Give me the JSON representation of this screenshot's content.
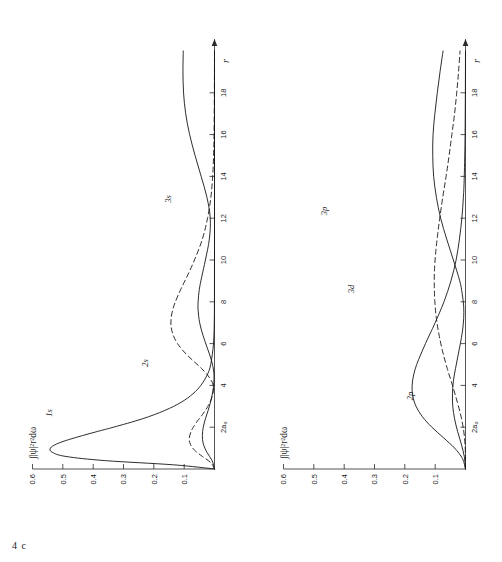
{
  "figures": [
    {
      "tag": "4 c",
      "y_axis_title": "∫|ψ|²r²dω",
      "y_ticks": [
        "0.1",
        "0.2",
        "0.3",
        "0.4",
        "0.5",
        "0.6"
      ],
      "x_ticks": [
        "2a₀",
        "4",
        "6",
        "8",
        "10",
        "12",
        "14",
        "16",
        "18"
      ],
      "x_axis_label": "r",
      "curve_labels": [
        "1s",
        "2s",
        "3s"
      ]
    },
    {
      "tag": "4 d",
      "y_axis_title": "∫|ψ|²r²dω",
      "y_ticks": [
        "0.1",
        "0.2",
        "0.3",
        "0.4",
        "0.5",
        "0.6"
      ],
      "x_ticks": [
        "2a₀",
        "4",
        "6",
        "8",
        "10",
        "12",
        "14",
        "16",
        "18"
      ],
      "x_axis_label": "r",
      "curve_labels": [
        "2p",
        "3d",
        "3p"
      ]
    }
  ],
  "chart_data": [
    {
      "type": "line",
      "title": "4 c",
      "xlabel": "r",
      "ylabel": "∫|ψ|²r²dω",
      "xlim": [
        0,
        20
      ],
      "ylim": [
        0,
        0.6
      ],
      "xticks": [
        2,
        4,
        6,
        8,
        10,
        12,
        14,
        16,
        18
      ],
      "xticklabels": [
        "2a₀",
        "4",
        "6",
        "8",
        "10",
        "12",
        "14",
        "16",
        "18"
      ],
      "yticks": [
        0.1,
        0.2,
        0.3,
        0.4,
        0.5,
        0.6
      ],
      "grid": false,
      "legend": "inline-curve-labels",
      "series": [
        {
          "name": "1s",
          "style": "solid",
          "x": [
            0,
            0.2,
            0.4,
            0.6,
            0.8,
            1.0,
            1.2,
            1.4,
            1.6,
            1.8,
            2.0,
            2.4,
            2.8,
            3.2,
            3.6,
            4.0,
            4.5,
            5.0,
            6.0,
            7.0,
            8.0,
            10.0,
            12.0,
            14.0,
            16.0,
            18.0,
            20.0
          ],
          "y": [
            0.0,
            0.135,
            0.36,
            0.49,
            0.535,
            0.541,
            0.52,
            0.482,
            0.435,
            0.385,
            0.333,
            0.238,
            0.164,
            0.109,
            0.071,
            0.045,
            0.024,
            0.0125,
            0.0032,
            0.0008,
            0.0002,
            0.0,
            0.0,
            0.0,
            0.0,
            0.0,
            0.0
          ]
        },
        {
          "name": "2s",
          "style": "dashed",
          "x": [
            0,
            0.3,
            0.6,
            0.9,
            1.2,
            1.5,
            1.8,
            2.0,
            2.3,
            2.6,
            3.0,
            3.5,
            4.0,
            4.4,
            4.8,
            5.2,
            5.6,
            6.0,
            6.4,
            6.8,
            7.2,
            7.6,
            8.0,
            8.6,
            9.2,
            10.0,
            11.0,
            12.0,
            13.0,
            14.0,
            15.0,
            16.0,
            18.0,
            20.0
          ],
          "y": [
            0.0,
            0.012,
            0.04,
            0.066,
            0.08,
            0.083,
            0.077,
            0.07,
            0.056,
            0.04,
            0.022,
            0.007,
            0.004,
            0.018,
            0.042,
            0.072,
            0.1,
            0.122,
            0.136,
            0.143,
            0.143,
            0.138,
            0.129,
            0.111,
            0.091,
            0.066,
            0.04,
            0.023,
            0.012,
            0.006,
            0.003,
            0.0015,
            0.0004,
            0.0
          ]
        },
        {
          "name": "3s",
          "style": "solid",
          "x": [
            0,
            0.4,
            0.8,
            1.2,
            1.6,
            2.0,
            2.4,
            2.8,
            3.2,
            3.6,
            4.0,
            4.6,
            5.2,
            5.8,
            6.4,
            7.0,
            7.6,
            8.0,
            8.6,
            9.2,
            10.0,
            11.0,
            12.0,
            13.0,
            14.0,
            15.0,
            16.0,
            17.0,
            18.0,
            19.0,
            20.0
          ],
          "y": [
            0.0,
            0.008,
            0.025,
            0.037,
            0.04,
            0.037,
            0.03,
            0.021,
            0.013,
            0.007,
            0.003,
            0.002,
            0.01,
            0.024,
            0.038,
            0.049,
            0.054,
            0.054,
            0.05,
            0.042,
            0.03,
            0.017,
            0.014,
            0.025,
            0.044,
            0.064,
            0.082,
            0.095,
            0.102,
            0.104,
            0.103
          ]
        }
      ]
    },
    {
      "type": "line",
      "title": "4 d",
      "xlabel": "r",
      "ylabel": "∫|ψ|²r²dω",
      "xlim": [
        0,
        20
      ],
      "ylim": [
        0,
        0.6
      ],
      "xticks": [
        2,
        4,
        6,
        8,
        10,
        12,
        14,
        16,
        18
      ],
      "xticklabels": [
        "2a₀",
        "4",
        "6",
        "8",
        "10",
        "12",
        "14",
        "16",
        "18"
      ],
      "yticks": [
        0.1,
        0.2,
        0.3,
        0.4,
        0.5,
        0.6
      ],
      "grid": false,
      "legend": "inline-curve-labels",
      "series": [
        {
          "name": "2p",
          "style": "solid",
          "x": [
            0,
            0.5,
            1.0,
            1.5,
            2.0,
            2.5,
            3.0,
            3.5,
            4.0,
            4.5,
            5.0,
            5.5,
            6.0,
            6.5,
            7.0,
            8.0,
            9.0,
            10.0,
            11.0,
            12.0,
            13.0,
            14.0,
            16.0,
            18.0,
            20.0
          ],
          "y": [
            0.0,
            0.01,
            0.036,
            0.073,
            0.111,
            0.142,
            0.163,
            0.174,
            0.176,
            0.171,
            0.161,
            0.147,
            0.132,
            0.116,
            0.1,
            0.071,
            0.048,
            0.031,
            0.02,
            0.012,
            0.007,
            0.004,
            0.0013,
            0.0004,
            0.0
          ]
        },
        {
          "name": "3p",
          "style": "solid",
          "x": [
            0,
            0.6,
            1.2,
            1.8,
            2.4,
            3.0,
            3.6,
            4.2,
            4.8,
            5.4,
            6.0,
            6.6,
            7.2,
            7.8,
            8.4,
            9.0,
            10.0,
            11.0,
            12.0,
            13.0,
            14.0,
            15.0,
            16.0,
            17.0,
            18.0,
            19.0,
            20.0
          ],
          "y": [
            0.0,
            0.004,
            0.014,
            0.026,
            0.036,
            0.042,
            0.043,
            0.04,
            0.033,
            0.025,
            0.017,
            0.01,
            0.006,
            0.006,
            0.011,
            0.019,
            0.04,
            0.062,
            0.082,
            0.096,
            0.105,
            0.108,
            0.107,
            0.101,
            0.093,
            0.084,
            0.074
          ]
        },
        {
          "name": "3d",
          "style": "dashed",
          "x": [
            0,
            0.8,
            1.6,
            2.4,
            3.2,
            4.0,
            4.8,
            5.6,
            6.4,
            7.2,
            8.0,
            8.8,
            9.6,
            10.4,
            11.2,
            12.0,
            13.0,
            14.0,
            15.0,
            16.0,
            17.0,
            18.0,
            19.0,
            20.0
          ],
          "y": [
            0.0,
            0.0004,
            0.004,
            0.013,
            0.027,
            0.043,
            0.06,
            0.075,
            0.087,
            0.096,
            0.101,
            0.103,
            0.102,
            0.098,
            0.092,
            0.085,
            0.075,
            0.064,
            0.054,
            0.045,
            0.036,
            0.029,
            0.023,
            0.018
          ]
        }
      ]
    }
  ]
}
